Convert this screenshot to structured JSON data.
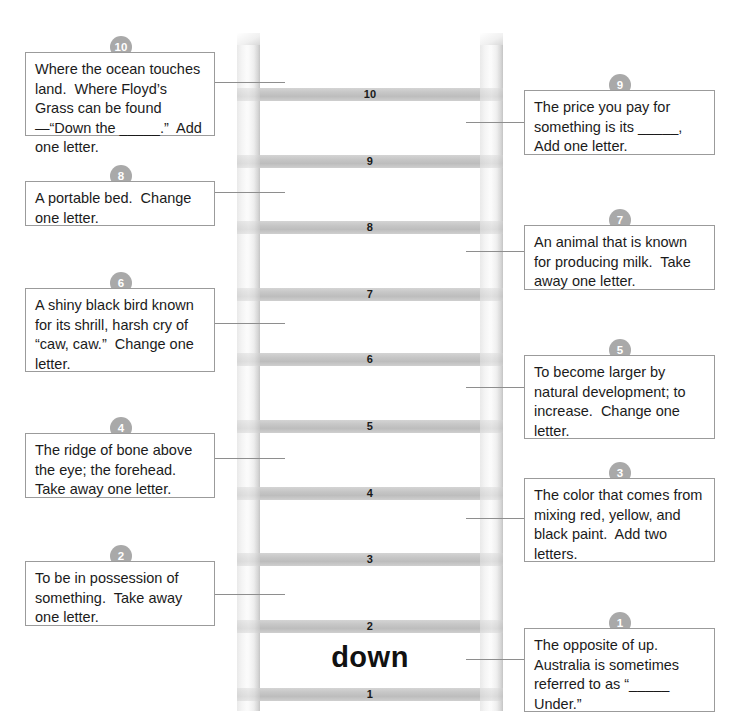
{
  "puzzle": {
    "type": "word-ladder",
    "solved_word": "down",
    "rungs": [
      {
        "number": "10"
      },
      {
        "number": "9"
      },
      {
        "number": "8"
      },
      {
        "number": "7"
      },
      {
        "number": "6"
      },
      {
        "number": "5"
      },
      {
        "number": "4"
      },
      {
        "number": "3"
      },
      {
        "number": "2"
      },
      {
        "number": "1"
      }
    ],
    "clues_left": [
      {
        "number": "10",
        "text": "Where the ocean touches land.  Where Floyd’s Grass can be found—“Down the _____.”  Add one letter."
      },
      {
        "number": "8",
        "text": "A portable bed.  Change one letter."
      },
      {
        "number": "6",
        "text": "A shiny black bird known for its shrill, harsh cry of “caw, caw.”  Change one letter."
      },
      {
        "number": "4",
        "text": "The ridge of bone above the eye; the forehead.  Take away one letter."
      },
      {
        "number": "2",
        "text": "To be in possession of something.  Take away one letter."
      }
    ],
    "clues_right": [
      {
        "number": "9",
        "text": "The price you pay for something is its _____,  Add one letter."
      },
      {
        "number": "7",
        "text": "An animal that is known for producing milk.  Take away one letter."
      },
      {
        "number": "5",
        "text": "To become larger by natural development; to increase.  Change one letter."
      },
      {
        "number": "3",
        "text": "The color that comes from mixing red, yellow, and black paint.  Add two letters."
      },
      {
        "number": "1",
        "text": "The opposite of up.  Australia is sometimes referred to as “_____ Under.”"
      }
    ]
  },
  "colors": {
    "rail": "#f2f2f2",
    "rung": "#c6c6c6",
    "badge": "#a9a9a9",
    "box_border": "#9b9b9b",
    "text": "#1b1b1b",
    "connector": "#8e8e8e"
  }
}
